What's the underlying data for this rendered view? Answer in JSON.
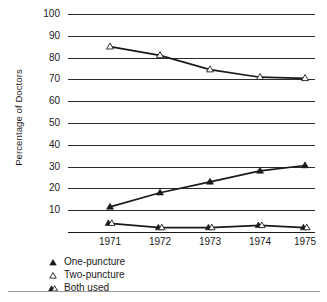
{
  "chart_data": {
    "type": "line",
    "title": "",
    "xlabel": "",
    "ylabel": "Percentage of Doctors",
    "categories": [
      "1971",
      "1972",
      "1973",
      "1974",
      "1975"
    ],
    "ylim": [
      0,
      100
    ],
    "yticks": [
      100,
      90,
      80,
      70,
      60,
      50,
      40,
      30,
      20,
      10
    ],
    "grid": true,
    "legend_position": "below-left",
    "series": [
      {
        "name": "One-puncture",
        "marker": "filled-triangle",
        "values": [
          11.5,
          18,
          23,
          28,
          30.5
        ]
      },
      {
        "name": "Two-puncture",
        "marker": "open-triangle",
        "values": [
          85,
          81,
          74.5,
          71,
          70.5
        ]
      },
      {
        "name": "Both used",
        "marker": "filled-and-open-triangle",
        "values": [
          4,
          2,
          2,
          3,
          2
        ]
      }
    ]
  },
  "legend": {
    "items": [
      {
        "label": "One-puncture",
        "marker": "filled-triangle"
      },
      {
        "label": "Two-puncture",
        "marker": "open-triangle"
      },
      {
        "label": "Both used",
        "marker": "filled-and-open-triangle"
      }
    ]
  },
  "colors": {
    "ink": "#1a1a1a",
    "gridline": "#2b2b2b",
    "rule": "#9a9a9a",
    "background": "#ffffff"
  }
}
